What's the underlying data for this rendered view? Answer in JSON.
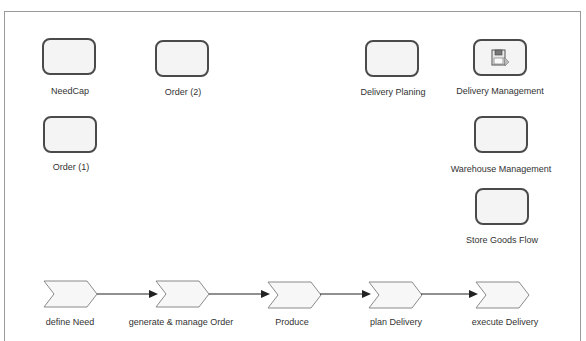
{
  "diagram": {
    "systems": [
      {
        "id": "needcap",
        "label": "NeedCap"
      },
      {
        "id": "order2",
        "label": "Order (2)"
      },
      {
        "id": "order1",
        "label": "Order (1)"
      },
      {
        "id": "delivery_planing",
        "label": "Delivery Planing"
      },
      {
        "id": "delivery_management",
        "label": "Delivery Management",
        "icon": "floppy-disk-icon"
      },
      {
        "id": "warehouse_management",
        "label": "Warehouse Management"
      },
      {
        "id": "store_goods_flow",
        "label": "Store Goods Flow"
      }
    ],
    "process_steps": [
      {
        "label": "define Need"
      },
      {
        "label": "generate & manage Order"
      },
      {
        "label": "Produce"
      },
      {
        "label": "plan Delivery"
      },
      {
        "label": "execute Delivery"
      }
    ],
    "flow": [
      {
        "from": "define Need",
        "to": "generate & manage Order"
      },
      {
        "from": "generate & manage Order",
        "to": "Produce"
      },
      {
        "from": "Produce",
        "to": "plan Delivery"
      },
      {
        "from": "plan Delivery",
        "to": "execute Delivery"
      }
    ],
    "colors": {
      "border": "#4a4a4a",
      "fill": "#f4f4f4",
      "frame": "#9a9a9a",
      "arrow": "#222222"
    }
  }
}
